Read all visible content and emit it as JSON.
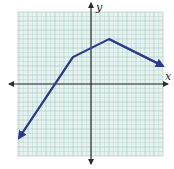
{
  "chart_data": {
    "type": "line",
    "title": "",
    "xlabel": "x",
    "ylabel": "y",
    "xlim": [
      -8,
      8
    ],
    "ylim": [
      -8,
      8
    ],
    "grid": true,
    "grid_step": 1,
    "series": [
      {
        "name": "piecewise linear function",
        "color": "#2b3a8f",
        "arrows": "both",
        "x": [
          -8,
          -2,
          2,
          8
        ],
        "y": [
          -6,
          3,
          5,
          2
        ]
      }
    ],
    "annotations": []
  },
  "axes": {
    "x_label": "x",
    "y_label": "y"
  },
  "colors": {
    "grid_fill": "#e6f2f0",
    "grid_line": "#a9cdc6",
    "axis": "#2a2a2a",
    "line": "#2b3a8f"
  }
}
